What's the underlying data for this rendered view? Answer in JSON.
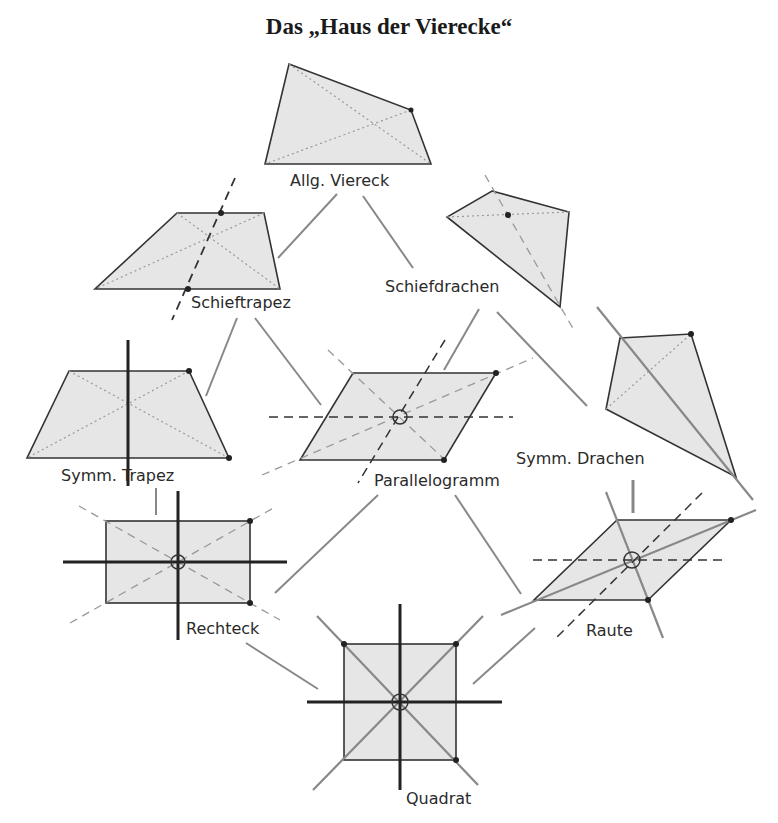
{
  "title": "Das „Haus der Vierecke“",
  "shapes": {
    "allg_viereck": "Allg. Viereck",
    "schieftrapez": "Schieftrapez",
    "schiefdrachen": "Schiefdrachen",
    "symm_trapez": "Symm. Trapez",
    "parallelogramm": "Parallelogramm",
    "symm_drachen": "Symm. Drachen",
    "rechteck": "Rechteck",
    "raute": "Raute",
    "quadrat": "Quadrat"
  },
  "hierarchy": [
    {
      "from": "Allg. Viereck",
      "to": "Schieftrapez"
    },
    {
      "from": "Allg. Viereck",
      "to": "Schiefdrachen"
    },
    {
      "from": "Schieftrapez",
      "to": "Symm. Trapez"
    },
    {
      "from": "Schieftrapez",
      "to": "Parallelogramm"
    },
    {
      "from": "Schiefdrachen",
      "to": "Parallelogramm"
    },
    {
      "from": "Schiefdrachen",
      "to": "Symm. Drachen"
    },
    {
      "from": "Symm. Trapez",
      "to": "Rechteck"
    },
    {
      "from": "Parallelogramm",
      "to": "Rechteck"
    },
    {
      "from": "Parallelogramm",
      "to": "Raute"
    },
    {
      "from": "Symm. Drachen",
      "to": "Raute"
    },
    {
      "from": "Rechteck",
      "to": "Quadrat"
    },
    {
      "from": "Raute",
      "to": "Quadrat"
    }
  ],
  "colors": {
    "fill": "#e6e6e6",
    "stroke": "#333333",
    "arrow": "#888888"
  }
}
